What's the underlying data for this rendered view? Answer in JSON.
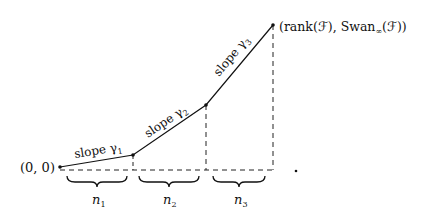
{
  "diagram": {
    "type": "newton-polygon",
    "origin_label": "(0, 0)",
    "endpoint_label": "(rank(ℱ), Swan∞(ℱ))",
    "endpoint_label_main": "(rank(ℱ), Swan",
    "endpoint_label_sub": "∞",
    "endpoint_label_tail": "(ℱ))",
    "segments": [
      {
        "label": "slope γ",
        "subscript": "1"
      },
      {
        "label": "slope γ",
        "subscript": "2"
      },
      {
        "label": "slope γ",
        "subscript": "3"
      }
    ],
    "braces": [
      {
        "label": "n",
        "subscript": "1"
      },
      {
        "label": "n",
        "subscript": "2"
      },
      {
        "label": "n",
        "subscript": "3"
      }
    ],
    "trailing_mark": "."
  }
}
